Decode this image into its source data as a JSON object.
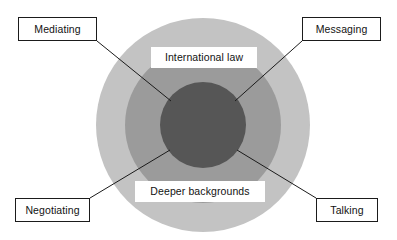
{
  "diagram": {
    "colors": {
      "outer_ring": "#c3c3c3",
      "middle_ring": "#9b9b9b",
      "inner_circle": "#565656",
      "label_background": "#ffffff",
      "line": "#1b1b1b",
      "text": "#121212"
    },
    "inner_labels": [
      {
        "id": "international-law",
        "text": "International law"
      },
      {
        "id": "deeper-backgrounds",
        "text": "Deeper backgrounds"
      }
    ],
    "callouts": [
      {
        "id": "mediating",
        "text": "Mediating"
      },
      {
        "id": "messaging",
        "text": "Messaging"
      },
      {
        "id": "negotiating",
        "text": "Negotiating"
      },
      {
        "id": "talking",
        "text": "Talking"
      }
    ],
    "connectors": [
      {
        "id": "mediating-connector",
        "from": "mediating",
        "x1": 97,
        "y1": 41,
        "x2": 171,
        "y2": 101
      },
      {
        "id": "messaging-connector",
        "from": "messaging",
        "x1": 302,
        "y1": 41,
        "x2": 235,
        "y2": 101
      },
      {
        "id": "negotiating-connector",
        "from": "negotiating",
        "x1": 90,
        "y1": 198,
        "x2": 170,
        "y2": 150
      },
      {
        "id": "talking-connector",
        "from": "talking",
        "x1": 316,
        "y1": 198,
        "x2": 237,
        "y2": 150
      }
    ]
  }
}
